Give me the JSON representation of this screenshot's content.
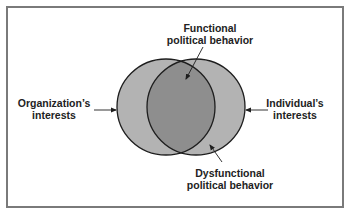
{
  "diagram": {
    "type": "venn",
    "colors": {
      "frame_border": "#7a7a7a",
      "circle_fill": "#b3b3b3",
      "overlap_fill": "#8e8e8e",
      "outline": "#1e1e1e",
      "text": "#222222"
    },
    "sets": [
      {
        "id": "organization",
        "line1": "Organization’s",
        "line2": "interests"
      },
      {
        "id": "individual",
        "line1": "Individual’s",
        "line2": "interests"
      }
    ],
    "regions": {
      "functional": {
        "line1": "Functional",
        "line2": "political behavior"
      },
      "dysfunctional": {
        "line1": "Dysfunctional",
        "line2": "political behavior"
      }
    }
  }
}
